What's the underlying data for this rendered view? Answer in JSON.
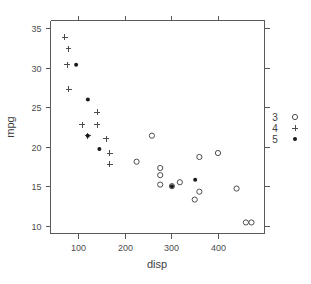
{
  "chart_data": {
    "type": "scatter",
    "title": "",
    "xlabel": "disp",
    "ylabel": "mpg",
    "xlim": [
      40,
      500
    ],
    "ylim": [
      9,
      36
    ],
    "xticks": [
      100,
      200,
      300,
      400
    ],
    "yticks": [
      10,
      15,
      20,
      25,
      30,
      35
    ],
    "xtick_labels": [
      "100",
      "200",
      "300",
      "400"
    ],
    "ytick_labels": [
      "10",
      "15",
      "20",
      "25",
      "30",
      "35"
    ],
    "grid": false,
    "legend_position": "right-margin",
    "legend_title": "",
    "series": [
      {
        "name": "3",
        "marker": "open-circle",
        "color": "#4d4d4d",
        "points": [
          {
            "x": 258.0,
            "y": 21.4
          },
          {
            "x": 225.0,
            "y": 18.1
          },
          {
            "x": 275.8,
            "y": 17.3
          },
          {
            "x": 275.8,
            "y": 16.4
          },
          {
            "x": 275.8,
            "y": 15.2
          },
          {
            "x": 301.0,
            "y": 15.0
          },
          {
            "x": 318.0,
            "y": 15.5
          },
          {
            "x": 350.0,
            "y": 13.3
          },
          {
            "x": 360.0,
            "y": 14.3
          },
          {
            "x": 360.0,
            "y": 18.7
          },
          {
            "x": 400.0,
            "y": 19.2
          },
          {
            "x": 440.0,
            "y": 14.7
          },
          {
            "x": 460.0,
            "y": 10.4
          },
          {
            "x": 472.0,
            "y": 10.4
          }
        ]
      },
      {
        "name": "4",
        "marker": "plus",
        "color": "#4d4d4d",
        "points": [
          {
            "x": 71.1,
            "y": 33.9
          },
          {
            "x": 78.7,
            "y": 32.4
          },
          {
            "x": 75.7,
            "y": 30.4
          },
          {
            "x": 79.0,
            "y": 27.3
          },
          {
            "x": 140.8,
            "y": 24.4
          },
          {
            "x": 108.0,
            "y": 22.8
          },
          {
            "x": 140.8,
            "y": 22.8
          },
          {
            "x": 120.1,
            "y": 21.4
          },
          {
            "x": 160.0,
            "y": 21.0
          },
          {
            "x": 160.0,
            "y": 21.0
          },
          {
            "x": 167.6,
            "y": 19.2
          },
          {
            "x": 167.6,
            "y": 17.8
          }
        ]
      },
      {
        "name": "5",
        "marker": "filled-dot",
        "color": "#1a1a1a",
        "points": [
          {
            "x": 95.1,
            "y": 30.4
          },
          {
            "x": 120.3,
            "y": 26.0
          },
          {
            "x": 120.1,
            "y": 21.4
          },
          {
            "x": 145.0,
            "y": 19.7
          },
          {
            "x": 301.0,
            "y": 15.0
          },
          {
            "x": 351.0,
            "y": 15.8
          }
        ]
      }
    ]
  },
  "legend": {
    "entries": [
      {
        "label": "3",
        "marker": "open-circle"
      },
      {
        "label": "4",
        "marker": "plus"
      },
      {
        "label": "5",
        "marker": "filled-dot"
      }
    ]
  },
  "colors": {
    "axis": "#595959",
    "tick_text": "#4d4d4d",
    "title_text": "#3d3d3d",
    "marker_open": "#4d4d4d",
    "marker_filled": "#1a1a1a",
    "background": "#ffffff"
  }
}
